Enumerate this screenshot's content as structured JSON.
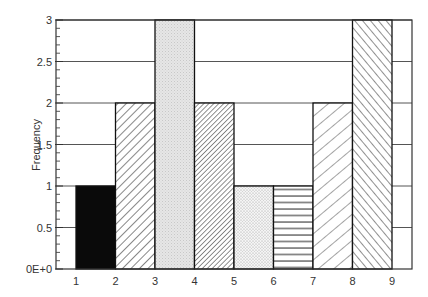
{
  "chart_data": {
    "type": "bar",
    "title": "",
    "xlabel": "",
    "ylabel": "Frequency",
    "x_edges": [
      1,
      2,
      3,
      4,
      5,
      6,
      7,
      8,
      9
    ],
    "x_tick_labels": [
      "1",
      "2",
      "3",
      "4",
      "5",
      "6",
      "7",
      "8",
      "9"
    ],
    "bins": [
      {
        "from": 1,
        "to": 2,
        "value": 1,
        "pattern": "solid-black"
      },
      {
        "from": 2,
        "to": 3,
        "value": 2,
        "pattern": "diagonal-forward"
      },
      {
        "from": 3,
        "to": 4,
        "value": 3,
        "pattern": "light-stipple"
      },
      {
        "from": 4,
        "to": 5,
        "value": 2,
        "pattern": "diagonal-forward-dense"
      },
      {
        "from": 5,
        "to": 6,
        "value": 1,
        "pattern": "dots"
      },
      {
        "from": 6,
        "to": 7,
        "value": 1,
        "pattern": "horizontal-lines"
      },
      {
        "from": 7,
        "to": 8,
        "value": 2,
        "pattern": "diagonal-forward-wide"
      },
      {
        "from": 8,
        "to": 9,
        "value": 3,
        "pattern": "diagonal-backward"
      }
    ],
    "categories": [
      "1-2",
      "2-3",
      "3-4",
      "4-5",
      "5-6",
      "6-7",
      "7-8",
      "8-9"
    ],
    "values": [
      1,
      2,
      3,
      2,
      1,
      1,
      2,
      3
    ],
    "y_ticks": [
      0,
      0.5,
      1,
      1.5,
      2,
      2.5,
      3
    ],
    "y_tick_labels": [
      "0E+0",
      "0.5",
      "1",
      "1.5",
      "2",
      "2.5",
      "3"
    ],
    "ylim": [
      0,
      3
    ],
    "xlim": [
      0.5,
      9.5
    ],
    "grid": "horizontal",
    "legend": null
  }
}
